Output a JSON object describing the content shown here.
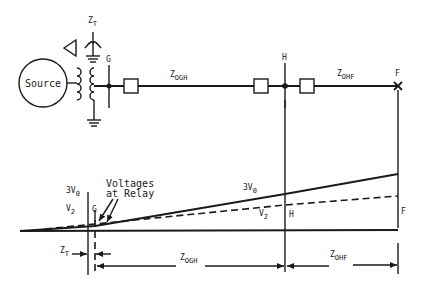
{
  "diagram": {
    "colors": {
      "ink": "#1a1a1a",
      "background": "#ffffff"
    },
    "one_line": {
      "source_label": "Source",
      "transformer_label": "Z",
      "transformer_sub": "T",
      "delta_symbol": "delta-icon",
      "bus_g_label": "G",
      "bus_h_label": "H",
      "fault_label": "F",
      "line_gh_label": "Z",
      "line_gh_sub": "OGH",
      "line_hf_label": "Z",
      "line_hf_sub": "OHF"
    },
    "profile": {
      "series": [
        {
          "name": "3V0",
          "label": "3V",
          "sub": "0",
          "style": "solid"
        },
        {
          "name": "V2",
          "label": "V",
          "sub": "2",
          "style": "dashed"
        }
      ],
      "left_3v0_label": "3V",
      "left_3v0_sub": "0",
      "left_v2_label": "V",
      "left_v2_sub": "2",
      "mid_3v0_label": "3V",
      "mid_3v0_sub": "0",
      "mid_v2_label": "V",
      "mid_v2_sub": "2",
      "g_label": "G",
      "h_label": "H",
      "f_label": "F",
      "annotation_line1": "Voltages",
      "annotation_line2": "at Relay"
    },
    "dimensions": {
      "zt_label": "Z",
      "zt_sub": "T",
      "zogh_label": "Z",
      "zogh_sub": "OGH",
      "zohf_label": "Z",
      "zohf_sub": "OHF"
    }
  }
}
